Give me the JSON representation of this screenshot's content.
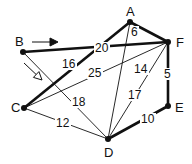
{
  "graph": {
    "nodes": [
      {
        "id": "A",
        "x": 130,
        "y": 22,
        "label": "A",
        "lx": 126,
        "ly": 16
      },
      {
        "id": "B",
        "x": 23,
        "y": 52,
        "label": "B",
        "lx": 15,
        "ly": 46
      },
      {
        "id": "C",
        "x": 24,
        "y": 108,
        "label": "C",
        "lx": 11,
        "ly": 112
      },
      {
        "id": "D",
        "x": 108,
        "y": 139,
        "label": "D",
        "lx": 104,
        "ly": 157
      },
      {
        "id": "E",
        "x": 168,
        "y": 106,
        "label": "E",
        "lx": 175,
        "ly": 112
      },
      {
        "id": "F",
        "x": 168,
        "y": 42,
        "label": "F",
        "lx": 176,
        "ly": 47
      }
    ],
    "edges": [
      {
        "from": "A",
        "to": "C",
        "weight": "16",
        "bold": true,
        "lx": 62,
        "ly": 68
      },
      {
        "from": "A",
        "to": "F",
        "weight": "6",
        "bold": true,
        "lx": 131,
        "ly": 36
      },
      {
        "from": "A",
        "to": "D",
        "weight": "14",
        "bold": false,
        "lx": 134,
        "ly": 73
      },
      {
        "from": "B",
        "to": "F",
        "weight": "20",
        "bold": true,
        "lx": 95,
        "ly": 52
      },
      {
        "from": "B",
        "to": "D",
        "weight": "18",
        "bold": false,
        "lx": 72,
        "ly": 106
      },
      {
        "from": "C",
        "to": "F",
        "weight": "25",
        "bold": false,
        "lx": 88,
        "ly": 77
      },
      {
        "from": "C",
        "to": "D",
        "weight": "12",
        "bold": false,
        "lx": 56,
        "ly": 127
      },
      {
        "from": "D",
        "to": "F",
        "weight": "17",
        "bold": false,
        "lx": 128,
        "ly": 99
      },
      {
        "from": "F",
        "to": "E",
        "weight": "5",
        "bold": true,
        "lx": 164,
        "ly": 78
      },
      {
        "from": "D",
        "to": "E",
        "weight": "10",
        "bold": true,
        "lx": 141,
        "ly": 123
      }
    ],
    "arrows": [
      {
        "name": "direction-arrow-filled",
        "x1": 32,
        "y1": 42,
        "x2": 58,
        "y2": 42,
        "style": "filled"
      },
      {
        "name": "direction-arrow-hollow",
        "x1": 24,
        "y1": 63,
        "x2": 42,
        "y2": 80,
        "style": "hollow"
      }
    ]
  }
}
